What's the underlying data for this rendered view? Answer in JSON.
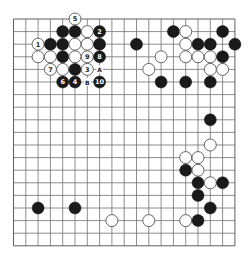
{
  "diagram": {
    "type": "go-board",
    "size": 19,
    "colors": {
      "background": "#ffffff",
      "grid": "#707070",
      "black": "#1a1a1a",
      "white": "#ffffff"
    },
    "stones": [
      {
        "color": "white",
        "col": 5,
        "row": 0,
        "label": "5"
      },
      {
        "color": "black",
        "col": 4,
        "row": 1,
        "label": ""
      },
      {
        "color": "black",
        "col": 5,
        "row": 1,
        "label": ""
      },
      {
        "color": "white",
        "col": 6,
        "row": 1,
        "label": ""
      },
      {
        "color": "black",
        "col": 7,
        "row": 1,
        "label": "2"
      },
      {
        "color": "white",
        "col": 2,
        "row": 2,
        "label": "1"
      },
      {
        "color": "black",
        "col": 3,
        "row": 2,
        "label": ""
      },
      {
        "color": "black",
        "col": 4,
        "row": 2,
        "label": ""
      },
      {
        "color": "white",
        "col": 5,
        "row": 2,
        "label": ""
      },
      {
        "color": "white",
        "col": 6,
        "row": 2,
        "label": ""
      },
      {
        "color": "black",
        "col": 7,
        "row": 2,
        "label": ""
      },
      {
        "color": "white",
        "col": 2,
        "row": 3,
        "label": ""
      },
      {
        "color": "white",
        "col": 3,
        "row": 3,
        "label": ""
      },
      {
        "color": "black",
        "col": 4,
        "row": 3,
        "label": ""
      },
      {
        "color": "white",
        "col": 5,
        "row": 3,
        "label": ""
      },
      {
        "color": "white",
        "col": 6,
        "row": 3,
        "label": "9"
      },
      {
        "color": "black",
        "col": 7,
        "row": 3,
        "label": "8"
      },
      {
        "color": "white",
        "col": 3,
        "row": 4,
        "label": "7"
      },
      {
        "color": "white",
        "col": 4,
        "row": 4,
        "label": ""
      },
      {
        "color": "black",
        "col": 5,
        "row": 4,
        "label": ""
      },
      {
        "color": "white",
        "col": 6,
        "row": 4,
        "label": "3"
      },
      {
        "color": "black",
        "col": 4,
        "row": 5,
        "label": "6"
      },
      {
        "color": "black",
        "col": 5,
        "row": 5,
        "label": "4"
      },
      {
        "color": "black",
        "col": 7,
        "row": 5,
        "label": "10"
      },
      {
        "color": "black",
        "col": 13,
        "row": 1,
        "label": ""
      },
      {
        "color": "white",
        "col": 14,
        "row": 1,
        "label": ""
      },
      {
        "color": "black",
        "col": 17,
        "row": 1,
        "label": ""
      },
      {
        "color": "black",
        "col": 10,
        "row": 2,
        "label": ""
      },
      {
        "color": "white",
        "col": 14,
        "row": 2,
        "label": ""
      },
      {
        "color": "black",
        "col": 15,
        "row": 2,
        "label": ""
      },
      {
        "color": "black",
        "col": 16,
        "row": 2,
        "label": ""
      },
      {
        "color": "black",
        "col": 18,
        "row": 2,
        "label": ""
      },
      {
        "color": "white",
        "col": 12,
        "row": 3,
        "label": ""
      },
      {
        "color": "white",
        "col": 14,
        "row": 3,
        "label": ""
      },
      {
        "color": "white",
        "col": 15,
        "row": 3,
        "label": ""
      },
      {
        "color": "white",
        "col": 16,
        "row": 3,
        "label": ""
      },
      {
        "color": "black",
        "col": 17,
        "row": 3,
        "label": ""
      },
      {
        "color": "white",
        "col": 11,
        "row": 4,
        "label": ""
      },
      {
        "color": "white",
        "col": 16,
        "row": 4,
        "label": ""
      },
      {
        "color": "white",
        "col": 17,
        "row": 4,
        "label": ""
      },
      {
        "color": "black",
        "col": 12,
        "row": 5,
        "label": ""
      },
      {
        "color": "black",
        "col": 14,
        "row": 5,
        "label": ""
      },
      {
        "color": "black",
        "col": 16,
        "row": 5,
        "label": ""
      },
      {
        "color": "black",
        "col": 16,
        "row": 8,
        "label": ""
      },
      {
        "color": "white",
        "col": 16,
        "row": 10,
        "label": ""
      },
      {
        "color": "white",
        "col": 14,
        "row": 11,
        "label": ""
      },
      {
        "color": "white",
        "col": 15,
        "row": 11,
        "label": ""
      },
      {
        "color": "black",
        "col": 14,
        "row": 12,
        "label": ""
      },
      {
        "color": "white",
        "col": 15,
        "row": 12,
        "label": ""
      },
      {
        "color": "black",
        "col": 15,
        "row": 13,
        "label": ""
      },
      {
        "color": "white",
        "col": 16,
        "row": 13,
        "label": ""
      },
      {
        "color": "black",
        "col": 17,
        "row": 13,
        "label": ""
      },
      {
        "color": "black",
        "col": 15,
        "row": 14,
        "label": ""
      },
      {
        "color": "black",
        "col": 16,
        "row": 15,
        "label": ""
      },
      {
        "color": "white",
        "col": 14,
        "row": 16,
        "label": ""
      },
      {
        "color": "black",
        "col": 15,
        "row": 16,
        "label": ""
      },
      {
        "color": "black",
        "col": 2,
        "row": 15,
        "label": ""
      },
      {
        "color": "black",
        "col": 5,
        "row": 15,
        "label": ""
      },
      {
        "color": "white",
        "col": 8,
        "row": 16,
        "label": ""
      },
      {
        "color": "white",
        "col": 11,
        "row": 16,
        "label": ""
      }
    ],
    "markers": [
      {
        "col": 7,
        "row": 4,
        "label": "A"
      },
      {
        "col": 6,
        "row": 5,
        "label": "B"
      }
    ]
  }
}
